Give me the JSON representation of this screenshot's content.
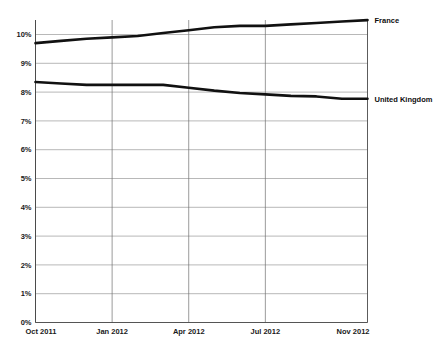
{
  "chart_data": {
    "type": "line",
    "title": "",
    "subtitle": "",
    "xlabel": "",
    "ylabel": "",
    "grid": true,
    "legend_position": "right-inline",
    "ylim": [
      0,
      10.6
    ],
    "ytick_values": [
      0,
      1,
      2,
      3,
      4,
      5,
      6,
      7,
      8,
      9,
      10
    ],
    "ytick_labels": [
      "0%",
      "1%",
      "2%",
      "3%",
      "4%",
      "5%",
      "6%",
      "7%",
      "8%",
      "9%",
      "10%"
    ],
    "x": [
      "Oct 2011",
      "Nov 2011",
      "Dec 2011",
      "Jan 2012",
      "Feb 2012",
      "Mar 2012",
      "Apr 2012",
      "May 2012",
      "Jun 2012",
      "Jul 2012",
      "Aug 2012",
      "Sep 2012",
      "Oct 2012",
      "Nov 2012"
    ],
    "xtick_labels": [
      "Oct 2011",
      "Jan 2012",
      "Apr 2012",
      "Jul 2012",
      "Nov 2012"
    ],
    "xtick_indices": [
      0,
      3,
      6,
      9,
      13
    ],
    "series": [
      {
        "name": "France",
        "color": "#111111",
        "values": [
          9.7,
          9.78,
          9.85,
          9.9,
          9.95,
          10.05,
          10.15,
          10.25,
          10.3,
          10.3,
          10.35,
          10.4,
          10.45,
          10.5
        ],
        "label_value": 10.5
      },
      {
        "name": "United Kingdom",
        "color": "#111111",
        "values": [
          8.35,
          8.3,
          8.25,
          8.25,
          8.25,
          8.25,
          8.15,
          8.05,
          7.97,
          7.92,
          7.87,
          7.85,
          7.77,
          7.77
        ],
        "label_value": 7.77
      }
    ]
  },
  "axis": {
    "y_axis_name": "percent-axis",
    "x_axis_name": "month-axis"
  }
}
